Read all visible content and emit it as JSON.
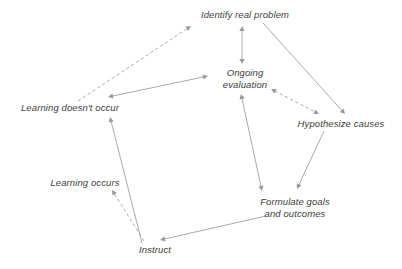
{
  "diagram": {
    "type": "node-link-diagram",
    "background_color": "#ffffff",
    "text_color": "#3d3d3d",
    "edge_color": "#9a9a9a",
    "canvas": {
      "width": 402,
      "height": 269
    },
    "nodes": [
      {
        "id": "identify-real-problem",
        "label": "Identify real problem",
        "lines": [
          "Identify real problem"
        ],
        "x": 245,
        "y": 15
      },
      {
        "id": "ongoing-evaluation",
        "label": "Ongoing evaluation",
        "lines": [
          "Ongoing",
          "evaluation"
        ],
        "x": 245,
        "y": 79
      },
      {
        "id": "hypothesize-causes",
        "label": "Hypothesize causes",
        "lines": [
          "Hypothesize causes"
        ],
        "x": 341,
        "y": 124
      },
      {
        "id": "learning-doesnt-occur",
        "label": "Learning doesn't occur",
        "lines": [
          "Learning doesn't occur"
        ],
        "x": 70,
        "y": 108
      },
      {
        "id": "learning-occurs",
        "label": "Learning occurs",
        "lines": [
          "Learning occurs"
        ],
        "x": 85,
        "y": 183
      },
      {
        "id": "formulate-goals-and-outcomes",
        "label": "Formulate goals and outcomes",
        "lines": [
          "Formulate goals",
          "and outcomes"
        ],
        "x": 295,
        "y": 208
      },
      {
        "id": "instruct",
        "label": "Instruct",
        "lines": [
          "Instruct"
        ],
        "x": 155,
        "y": 250
      }
    ],
    "edges": [
      {
        "id": "learning-doesnt-occur-to-identify-real-problem",
        "from": "learning-doesnt-occur",
        "to": "identify-real-problem",
        "style": "dashed",
        "arrows": "end",
        "x1": 78,
        "y1": 101,
        "x2": 191,
        "y2": 26
      },
      {
        "id": "identify-real-problem-to-ongoing-evaluation",
        "from": "identify-real-problem",
        "to": "ongoing-evaluation",
        "style": "solid",
        "arrows": "both",
        "x1": 242,
        "y1": 26,
        "x2": 242,
        "y2": 64
      },
      {
        "id": "identify-real-problem-to-hypothesize-causes",
        "from": "identify-real-problem",
        "to": "hypothesize-causes",
        "style": "solid",
        "arrows": "end",
        "x1": 263,
        "y1": 23,
        "x2": 345,
        "y2": 114
      },
      {
        "id": "ongoing-evaluation-to-hypothesize-causes",
        "from": "ongoing-evaluation",
        "to": "hypothesize-causes",
        "style": "dashed",
        "arrows": "both",
        "x1": 271,
        "y1": 89,
        "x2": 319,
        "y2": 114
      },
      {
        "id": "ongoing-evaluation-to-learning-doesnt-occur",
        "from": "ongoing-evaluation",
        "to": "learning-doesnt-occur",
        "style": "solid",
        "arrows": "both",
        "x1": 208,
        "y1": 76,
        "x2": 108,
        "y2": 97
      },
      {
        "id": "ongoing-evaluation-to-formulate-goals",
        "from": "ongoing-evaluation",
        "to": "formulate-goals-and-outcomes",
        "style": "solid",
        "arrows": "both",
        "x1": 241,
        "y1": 94,
        "x2": 262,
        "y2": 191
      },
      {
        "id": "hypothesize-causes-to-formulate-goals",
        "from": "hypothesize-causes",
        "to": "formulate-goals-and-outcomes",
        "style": "solid",
        "arrows": "end",
        "x1": 324,
        "y1": 131,
        "x2": 297,
        "y2": 189
      },
      {
        "id": "formulate-goals-to-instruct",
        "from": "formulate-goals-and-outcomes",
        "to": "instruct",
        "style": "solid",
        "arrows": "end",
        "x1": 266,
        "y1": 216,
        "x2": 160,
        "y2": 240
      },
      {
        "id": "instruct-to-learning-doesnt-occur",
        "from": "instruct",
        "to": "learning-doesnt-occur",
        "style": "solid",
        "arrows": "end",
        "x1": 142,
        "y1": 243,
        "x2": 110,
        "y2": 117
      },
      {
        "id": "instruct-to-learning-occurs",
        "from": "instruct",
        "to": "learning-occurs",
        "style": "dashed",
        "arrows": "end",
        "x1": 144,
        "y1": 241,
        "x2": 112,
        "y2": 190
      }
    ]
  }
}
